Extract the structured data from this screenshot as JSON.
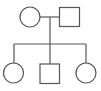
{
  "diagram": {
    "type": "pedigree",
    "stroke_color": "#555555",
    "background": "#ffffff",
    "generations": [
      {
        "label": "parents",
        "members": [
          {
            "id": "mother",
            "sex": "female",
            "shape": "circle",
            "affected": false
          },
          {
            "id": "father",
            "sex": "male",
            "shape": "square",
            "affected": false
          }
        ]
      },
      {
        "label": "children",
        "members": [
          {
            "id": "daughter-1",
            "sex": "female",
            "shape": "circle",
            "affected": false
          },
          {
            "id": "son",
            "sex": "male",
            "shape": "square",
            "affected": false
          },
          {
            "id": "daughter-2",
            "sex": "female",
            "shape": "circle",
            "affected": false
          }
        ]
      }
    ]
  }
}
